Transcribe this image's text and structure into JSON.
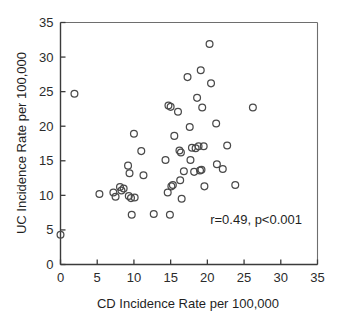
{
  "chart_data": {
    "type": "scatter",
    "title": "",
    "xlabel": "CD Incidence Rate per 100,000",
    "ylabel": "UC Incidence Rate per 100,000",
    "xlim": [
      0,
      35
    ],
    "ylim": [
      0,
      35
    ],
    "xticks": [
      0,
      5,
      10,
      15,
      20,
      25,
      30,
      35
    ],
    "yticks": [
      0,
      5,
      10,
      15,
      20,
      25,
      30,
      35
    ],
    "xtick_labels": [
      "0",
      "5",
      "10",
      "15",
      "20",
      "25",
      "30",
      "35"
    ],
    "ytick_labels": [
      "0",
      "5",
      "10",
      "15",
      "20",
      "25",
      "30",
      "35"
    ],
    "grid": false,
    "legend": null,
    "marker": "open-circle",
    "marker_color": "#4a4a4a",
    "annotation": "r=0.49, p<0.001",
    "correlation_r": 0.49,
    "p_value": "<0.001",
    "points": [
      [
        0.0,
        4.3
      ],
      [
        1.9,
        24.7
      ],
      [
        5.3,
        10.2
      ],
      [
        7.2,
        10.4
      ],
      [
        7.5,
        9.8
      ],
      [
        8.1,
        11.2
      ],
      [
        8.3,
        10.7
      ],
      [
        8.6,
        11.0
      ],
      [
        9.2,
        14.3
      ],
      [
        9.3,
        9.9
      ],
      [
        9.4,
        13.2
      ],
      [
        9.6,
        9.6
      ],
      [
        9.7,
        7.2
      ],
      [
        10.0,
        18.9
      ],
      [
        10.1,
        9.7
      ],
      [
        11.0,
        16.4
      ],
      [
        11.3,
        12.9
      ],
      [
        12.7,
        7.3
      ],
      [
        14.3,
        15.1
      ],
      [
        14.6,
        10.4
      ],
      [
        14.7,
        23.0
      ],
      [
        14.9,
        7.2
      ],
      [
        15.0,
        22.8
      ],
      [
        15.1,
        11.3
      ],
      [
        15.3,
        11.5
      ],
      [
        15.5,
        18.6
      ],
      [
        16.0,
        22.1
      ],
      [
        16.2,
        16.5
      ],
      [
        16.3,
        12.2
      ],
      [
        16.4,
        16.2
      ],
      [
        16.5,
        9.5
      ],
      [
        16.8,
        13.5
      ],
      [
        17.3,
        27.1
      ],
      [
        17.6,
        19.9
      ],
      [
        17.7,
        15.1
      ],
      [
        17.9,
        16.9
      ],
      [
        18.2,
        13.4
      ],
      [
        18.4,
        16.8
      ],
      [
        18.6,
        24.1
      ],
      [
        18.8,
        17.1
      ],
      [
        19.0,
        13.6
      ],
      [
        19.1,
        28.1
      ],
      [
        19.2,
        13.7
      ],
      [
        19.3,
        22.7
      ],
      [
        19.5,
        17.1
      ],
      [
        19.6,
        11.3
      ],
      [
        20.3,
        31.9
      ],
      [
        20.5,
        26.2
      ],
      [
        21.2,
        20.4
      ],
      [
        21.3,
        14.5
      ],
      [
        22.1,
        13.8
      ],
      [
        22.7,
        17.2
      ],
      [
        23.8,
        11.5
      ],
      [
        26.2,
        22.7
      ]
    ]
  }
}
